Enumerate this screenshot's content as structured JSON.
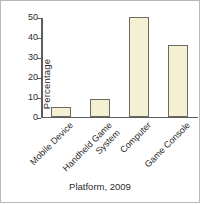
{
  "figure": {
    "border_color": "#b9b9b9",
    "background": "#ffffff"
  },
  "chart_data": {
    "type": "bar",
    "title": "",
    "subtitle": "",
    "xlabel": "Platform, 2009",
    "ylabel": "Percentage",
    "categories": [
      "Mobile Device",
      "Handheld Game System",
      "Computer",
      "Game Console"
    ],
    "category_lines": [
      [
        "Mobile Device"
      ],
      [
        "Handheld Game",
        "System"
      ],
      [
        "Computer"
      ],
      [
        "Game Console"
      ]
    ],
    "values": [
      5,
      9,
      50,
      36
    ],
    "ylim": [
      0,
      50
    ],
    "yticks": [
      0,
      10,
      20,
      30,
      40,
      50
    ],
    "ytick_labels": [
      "0",
      "10",
      "20",
      "30",
      "40",
      "50"
    ],
    "grid": false,
    "legend": false,
    "bar_fill_color": "#f5f0d3",
    "bar_edge_color": "#6a6a62",
    "axis_color": "#5d5d5d",
    "text_color": "#2b2b2b"
  }
}
